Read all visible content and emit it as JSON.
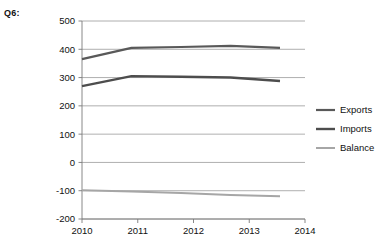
{
  "question_label": "Q6:",
  "chart_data": {
    "type": "line",
    "title": "",
    "xlabel": "",
    "ylabel": "",
    "categories": [
      "2010",
      "2011",
      "2012",
      "2013",
      "2014"
    ],
    "x_tick_labels": [
      "2010",
      "2011",
      "2012",
      "2013",
      "2014"
    ],
    "y_tick_labels": [
      "500",
      "400",
      "300",
      "200",
      "100",
      "0",
      "-100",
      "-200"
    ],
    "y_tick_values": [
      500,
      400,
      300,
      200,
      100,
      0,
      -100,
      -200
    ],
    "ylim": [
      -200,
      500
    ],
    "grid": "horizontal",
    "legend_position": "right",
    "series": [
      {
        "name": "Exports",
        "color": "#595959",
        "width": 2.2,
        "values": [
          365,
          405,
          408,
          412,
          405
        ]
      },
      {
        "name": "Imports",
        "color": "#4d4d4d",
        "width": 2.4,
        "values": [
          270,
          305,
          303,
          300,
          288
        ]
      },
      {
        "name": "Balance",
        "color": "#a6a6a6",
        "width": 2.0,
        "values": [
          -98,
          -103,
          -108,
          -115,
          -120
        ]
      }
    ],
    "legend_entries": [
      {
        "label": "Exports",
        "color": "#595959"
      },
      {
        "label": "Imports",
        "color": "#4d4d4d"
      },
      {
        "label": "Balance",
        "color": "#a6a6a6"
      }
    ]
  },
  "axis_color": "#7a7a7a",
  "grid_color": "#9a9a9a"
}
